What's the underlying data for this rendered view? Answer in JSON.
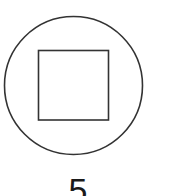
{
  "figure": {
    "outer_shape": "circle",
    "inner_shape": "square",
    "stroke_color": "#333333",
    "fill_color": "#ffffff",
    "label": "5"
  }
}
